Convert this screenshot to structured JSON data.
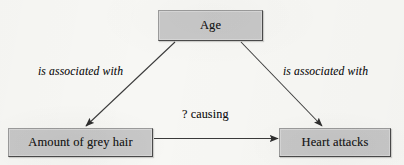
{
  "diagram": {
    "background_color": "#f7f7f4",
    "node_fill_color": "#c8c8c8",
    "node_border_color": "#4a4a4a",
    "text_color": "#1a1a1a",
    "arrow_color": "#3a3a3a"
  },
  "nodes": [
    {
      "id": "age",
      "label": "Age",
      "x": 158,
      "y": 10,
      "width": 105,
      "height": 31
    },
    {
      "id": "grey_hair",
      "label": "Amount of grey hair",
      "x": 8,
      "y": 128,
      "width": 145,
      "height": 29
    },
    {
      "id": "heart_attacks",
      "label": "Heart attacks",
      "x": 279,
      "y": 128,
      "width": 112,
      "height": 29
    }
  ],
  "edges": [
    {
      "id": "age_to_grey_hair",
      "from": "age",
      "to": "grey_hair",
      "label": "is associated with",
      "label_style": "italic",
      "label_x": 38,
      "label_y": 66,
      "arrowhead": "filled-triangle"
    },
    {
      "id": "age_to_heart_attacks",
      "from": "age",
      "to": "heart_attacks",
      "label": "is associated with",
      "label_style": "italic",
      "label_x": 283,
      "label_y": 66,
      "arrowhead": "filled-triangle"
    },
    {
      "id": "grey_hair_to_heart_attacks",
      "from": "grey_hair",
      "to": "heart_attacks",
      "label": "? causing",
      "label_style": "upright",
      "label_x": 182,
      "label_y": 108,
      "arrowhead": "filled-triangle"
    }
  ]
}
